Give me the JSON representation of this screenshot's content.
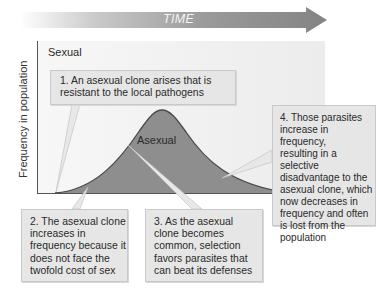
{
  "timeline": {
    "label": "TIME",
    "arrow_color": "#8a8a8a"
  },
  "chart": {
    "y_axis_label": "Frequency in population",
    "series_labels": {
      "sexual": "Sexual",
      "asexual": "Asexual"
    },
    "colors": {
      "background": "#efefef",
      "asexual_fill": "#8e8e8e",
      "asexual_outline": "#4a4a4a",
      "callout_fill": "#e6e6e6"
    }
  },
  "callouts": [
    {
      "step": 1,
      "text": "1. An asexual clone arises that is resistant to the local pathogens",
      "lines": [
        "1. An asexual clone arises that is",
        "resistant to the local pathogens"
      ]
    },
    {
      "step": 2,
      "text": "2. The asexual clone increases in frequency because it does not face the twofold cost of sex",
      "lines": [
        "2. The asexual clone",
        "increases in",
        "frequency because it",
        "does not face the",
        "twofold cost of sex"
      ]
    },
    {
      "step": 3,
      "text": "3. As the asexual clone becomes common, selection favors parasites that can beat its defenses",
      "lines": [
        "3. As the asexual",
        "clone becomes",
        "common, selection",
        "favors parasites that",
        "can beat its defenses"
      ]
    },
    {
      "step": 4,
      "text": "4. Those parasites increase in frequency, resulting in a selective disadvantage to the asexual clone, which now decreases in frequency and often is lost from the population",
      "lines": [
        "4. Those parasites",
        "increase in frequency,",
        "resulting in a selective",
        "disadvantage to the",
        "asexual clone, which",
        "now decreases in",
        "frequency and often",
        "is lost from the",
        "population"
      ]
    }
  ]
}
